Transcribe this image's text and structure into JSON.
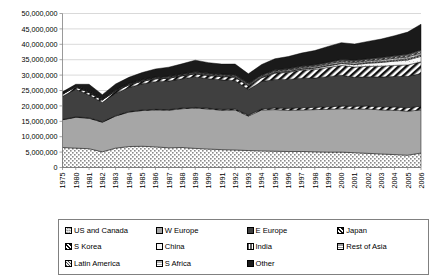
{
  "chart_data": {
    "type": "area",
    "stacked": true,
    "title": "",
    "xlabel": "",
    "ylabel": "",
    "ylim": [
      0,
      50000000
    ],
    "ytick_step": 5000000,
    "ytick_labels": [
      "0",
      "5,000,000",
      "10,000,000",
      "15,000,000",
      "20,000,000",
      "25,000,000",
      "30,000,000",
      "35,000,000",
      "40,000,000",
      "45,000,000",
      "50,000,000"
    ],
    "grid": true,
    "legend_position": "bottom",
    "x": [
      1975,
      1980,
      1981,
      1982,
      1983,
      1984,
      1985,
      1986,
      1987,
      1988,
      1989,
      1990,
      1991,
      1992,
      1993,
      1994,
      1995,
      1996,
      1997,
      1998,
      1999,
      2000,
      2001,
      2002,
      2003,
      2004,
      2005,
      2006
    ],
    "xtick_labels": [
      "1975",
      "1980",
      "1981",
      "1982",
      "1983",
      "1984",
      "1985",
      "1986",
      "1987",
      "1988",
      "1989",
      "1990",
      "1991",
      "1992",
      "1993",
      "1994",
      "1995",
      "1996",
      "1997",
      "1998",
      "1999",
      "2000",
      "2001",
      "2002",
      "2003",
      "2004",
      "2005",
      "2006"
    ],
    "series": [
      {
        "name": "US and Canada",
        "pattern": "dots",
        "fill": "#ffffff",
        "values": [
          6500000,
          6300000,
          6100000,
          5100000,
          6300000,
          6800000,
          6900000,
          6700000,
          6400000,
          6500000,
          6200000,
          6000000,
          5800000,
          5700000,
          5500000,
          5400000,
          5300000,
          5200000,
          5200000,
          5100000,
          5000000,
          5000000,
          4800000,
          4600000,
          4400000,
          4200000,
          4000000,
          4700000
        ]
      },
      {
        "name": "W Europe",
        "pattern": "solid",
        "fill": "#a6a6a6",
        "values": [
          9000000,
          10000000,
          9900000,
          9600000,
          10400000,
          11200000,
          11600000,
          12000000,
          12200000,
          12600000,
          13100000,
          13000000,
          12800000,
          13000000,
          11200000,
          13300000,
          13500000,
          13400000,
          13500000,
          13700000,
          13900000,
          14100000,
          14200000,
          14400000,
          14300000,
          14400000,
          14300000,
          14000000
        ]
      },
      {
        "name": "S Korea",
        "pattern": "diag-thick",
        "fill": "#ffffff",
        "values": [
          100000,
          120000,
          130000,
          140000,
          150000,
          160000,
          170000,
          180000,
          190000,
          200000,
          220000,
          240000,
          260000,
          280000,
          300000,
          320000,
          500000,
          600000,
          700000,
          750000,
          800000,
          850000,
          900000,
          950000,
          1000000,
          1050000,
          1100000,
          1200000
        ]
      },
      {
        "name": "E Europe",
        "pattern": "solid",
        "fill": "#404040",
        "values": [
          7500000,
          9000000,
          7400000,
          6300000,
          7200000,
          7800000,
          8500000,
          9000000,
          9300000,
          9500000,
          9900000,
          9600000,
          9600000,
          9200000,
          8300000,
          8900000,
          9300000,
          9400000,
          9600000,
          9500000,
          9800000,
          10000000,
          9400000,
          9500000,
          9700000,
          9900000,
          10200000,
          10600000
        ]
      },
      {
        "name": "Japan",
        "pattern": "diag-thick",
        "fill": "#ffffff",
        "values": [
          700000,
          750000,
          760000,
          780000,
          800000,
          830000,
          850000,
          880000,
          900000,
          930000,
          960000,
          1000000,
          1050000,
          1100000,
          1150000,
          1200000,
          2000000,
          2300000,
          2600000,
          2800000,
          3000000,
          3200000,
          3300000,
          3400000,
          3500000,
          3600000,
          3700000,
          3800000
        ]
      },
      {
        "name": "China",
        "pattern": "light",
        "fill": "#f2f2f2",
        "values": [
          60000,
          70000,
          75000,
          80000,
          85000,
          90000,
          95000,
          100000,
          110000,
          120000,
          130000,
          140000,
          150000,
          160000,
          170000,
          180000,
          200000,
          250000,
          300000,
          400000,
          500000,
          600000,
          800000,
          1000000,
          1200000,
          1400000,
          1600000,
          1800000
        ]
      },
      {
        "name": "India",
        "pattern": "vert",
        "fill": "#808080",
        "values": [
          50000,
          55000,
          58000,
          60000,
          62000,
          65000,
          68000,
          70000,
          73000,
          76000,
          80000,
          84000,
          88000,
          92000,
          96000,
          100000,
          110000,
          120000,
          130000,
          145000,
          160000,
          180000,
          200000,
          230000,
          260000,
          300000,
          340000,
          400000
        ]
      },
      {
        "name": "Rest of Asia",
        "pattern": "grid-gray",
        "fill": "#9a9a9a",
        "values": [
          150000,
          160000,
          165000,
          170000,
          175000,
          180000,
          190000,
          200000,
          210000,
          220000,
          235000,
          250000,
          265000,
          280000,
          300000,
          320000,
          350000,
          380000,
          410000,
          440000,
          470000,
          500000,
          540000,
          580000,
          620000,
          660000,
          700000,
          760000
        ]
      },
      {
        "name": "Latin America",
        "pattern": "diag-dark",
        "fill": "#595959",
        "values": [
          120000,
          130000,
          135000,
          140000,
          145000,
          150000,
          160000,
          170000,
          180000,
          190000,
          200000,
          210000,
          225000,
          240000,
          255000,
          270000,
          290000,
          310000,
          330000,
          350000,
          375000,
          400000,
          425000,
          450000,
          480000,
          510000,
          545000,
          580000
        ]
      },
      {
        "name": "S Africa",
        "pattern": "hgrid",
        "fill": "#b3b3b3",
        "values": [
          80000,
          85000,
          88000,
          90000,
          92000,
          95000,
          98000,
          100000,
          105000,
          110000,
          115000,
          120000,
          126000,
          132000,
          138000,
          145000,
          155000,
          165000,
          175000,
          185000,
          195000,
          205000,
          218000,
          230000,
          245000,
          260000,
          275000,
          290000
        ]
      },
      {
        "name": "Other",
        "pattern": "solid",
        "fill": "#1a1a1a",
        "values": [
          300000,
          350000,
          2200000,
          1200000,
          1700000,
          1900000,
          2200000,
          2600000,
          2900000,
          3200000,
          3700000,
          3400000,
          3200000,
          3400000,
          3000000,
          3300000,
          3600000,
          3900000,
          4200000,
          4600000,
          5100000,
          5500000,
          5300000,
          5600000,
          6000000,
          6500000,
          7200000,
          8400000
        ]
      }
    ]
  },
  "legend": {
    "items": [
      {
        "label": "US and Canada",
        "key": "us-and-canada"
      },
      {
        "label": "W Europe",
        "key": "w-europe"
      },
      {
        "label": "E Europe",
        "key": "e-europe"
      },
      {
        "label": "Japan",
        "key": "japan"
      },
      {
        "label": "S Korea",
        "key": "s-korea"
      },
      {
        "label": "China",
        "key": "china"
      },
      {
        "label": "India",
        "key": "india"
      },
      {
        "label": "Rest of Asia",
        "key": "rest-of-asia"
      },
      {
        "label": "Latin America",
        "key": "latin-america"
      },
      {
        "label": "S Africa",
        "key": "s-africa"
      },
      {
        "label": "Other",
        "key": "other"
      }
    ]
  },
  "colors": {
    "axis": "#808080",
    "grid": "#bfbfbf",
    "text": "#000000",
    "plot_background": "#ffffff"
  }
}
